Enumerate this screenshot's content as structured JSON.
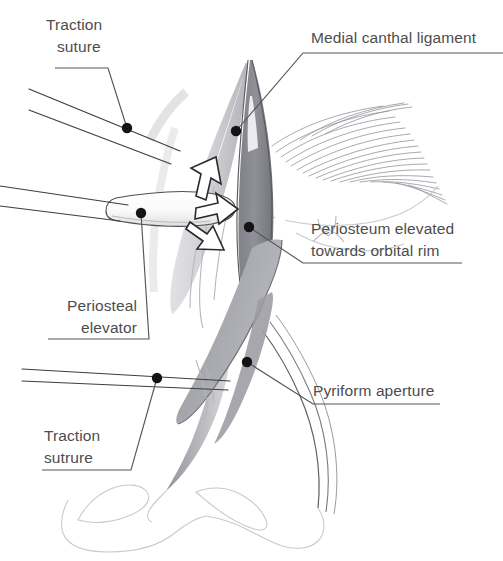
{
  "figure": {
    "background_color": "#ffffff",
    "width": 503,
    "height": 561
  },
  "colors": {
    "label_text": "#4d4d4d",
    "leader_line": "#55555c",
    "leader_dot": "#141414",
    "suture": "#3d3d44",
    "mid_gray_fill": "#8a8a8a",
    "light_gray_fill": "#c6c6cb",
    "faint_outline": "#c9c9cf",
    "arrow_fill": "#ffffff",
    "arrow_stroke": "#2a2a2a"
  },
  "labels": [
    {
      "id": "traction-suture-top",
      "line1": "Traction",
      "line2": "suture",
      "align": "left",
      "position": "top-left"
    },
    {
      "id": "medial-canthal-ligament",
      "line1": "Medial canthal ligament",
      "line2": "",
      "align": "left",
      "position": "top-right"
    },
    {
      "id": "periosteum-elevated",
      "line1": "Periosteum elevated",
      "line2": "towards orbital rim",
      "align": "left",
      "position": "middle-right"
    },
    {
      "id": "periosteal-elevator",
      "line1": "Periosteal",
      "line2": "elevator",
      "align": "right",
      "position": "middle-left"
    },
    {
      "id": "pyriform-aperture",
      "line1": "Pyriform aperture",
      "line2": "",
      "align": "left",
      "position": "bottom-right"
    },
    {
      "id": "traction-sutrure-bottom",
      "line1": "Traction",
      "line2": "sutrure",
      "align": "left",
      "position": "bottom-left"
    }
  ],
  "annotations": {
    "arrow_count": 3,
    "arrow_direction": "towards orbital rim (rightward)",
    "suture_pairs": 3
  }
}
